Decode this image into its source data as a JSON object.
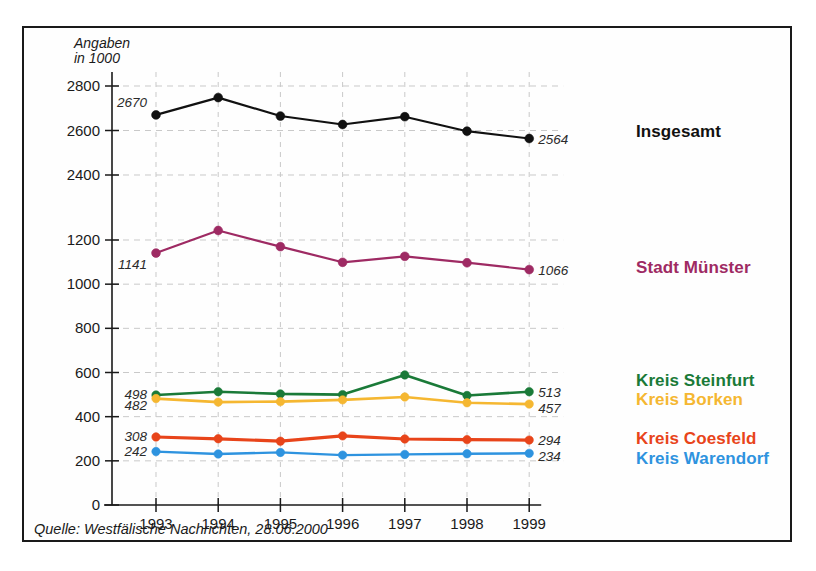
{
  "unit_caption": "Angaben\nin 1000",
  "source_note": "Quelle: Westfälische Nachrichten, 28.06.2000",
  "axis": {
    "x_ticks": [
      "1993",
      "1994",
      "1995",
      "1996",
      "1997",
      "1998",
      "1999"
    ],
    "y_ticks_lower": [
      "0",
      "200",
      "400",
      "600",
      "800",
      "1000",
      "1200"
    ],
    "y_ticks_upper": [
      "2400",
      "2600",
      "2800"
    ]
  },
  "legend": [
    {
      "key": "insgesamt",
      "label": "Insgesamt",
      "color": "#111111"
    },
    {
      "key": "muenster",
      "label": "Stadt Münster",
      "color": "#9e2a63"
    },
    {
      "key": "steinfurt",
      "label": "Kreis Steinfurt",
      "color": "#1a7a38"
    },
    {
      "key": "borken",
      "label": "Kreis Borken",
      "color": "#f5b731"
    },
    {
      "key": "coesfeld",
      "label": "Kreis Coesfeld",
      "color": "#e8441a"
    },
    {
      "key": "warendorf",
      "label": "Kreis Warendorf",
      "color": "#2e93df"
    }
  ],
  "chart_data": {
    "type": "line",
    "title": "",
    "subtitle": "",
    "xlabel": "",
    "ylabel": "Angaben in 1000",
    "x": [
      1993,
      1994,
      1995,
      1996,
      1997,
      1998,
      1999
    ],
    "categories": [
      "1993",
      "1994",
      "1995",
      "1996",
      "1997",
      "1998",
      "1999"
    ],
    "grid": true,
    "legend_position": "right",
    "axis_note": "broken y-axis: upper panel 2400-2800, lower panel 0-1200",
    "ylim_upper": [
      2300,
      2850
    ],
    "ylim_lower": [
      0,
      1300
    ],
    "series": [
      {
        "name": "Insgesamt",
        "color": "#111111",
        "panel": "upper",
        "values": [
          2670,
          2748,
          2665,
          2627,
          2662,
          2597,
          2564
        ],
        "start_label": "2670",
        "end_label": "2564"
      },
      {
        "name": "Stadt Münster",
        "color": "#9e2a63",
        "panel": "lower",
        "values": [
          1141,
          1243,
          1170,
          1099,
          1126,
          1097,
          1066
        ],
        "start_label": "1141",
        "end_label": "1066"
      },
      {
        "name": "Kreis Steinfurt",
        "color": "#1a7a38",
        "panel": "lower",
        "values": [
          498,
          513,
          503,
          500,
          589,
          496,
          513
        ],
        "start_label": "498",
        "end_label": "513"
      },
      {
        "name": "Kreis Borken",
        "color": "#f5b731",
        "panel": "lower",
        "values": [
          482,
          466,
          468,
          476,
          489,
          463,
          457
        ],
        "start_label": "482",
        "end_label": "457"
      },
      {
        "name": "Kreis Coesfeld",
        "color": "#e8441a",
        "panel": "lower",
        "values": [
          308,
          300,
          289,
          313,
          299,
          296,
          294
        ],
        "start_label": "308",
        "end_label": "294"
      },
      {
        "name": "Kreis Warendorf",
        "color": "#2e93df",
        "panel": "lower",
        "values": [
          242,
          231,
          238,
          226,
          229,
          232,
          234
        ],
        "start_label": "242",
        "end_label": "234"
      }
    ]
  }
}
